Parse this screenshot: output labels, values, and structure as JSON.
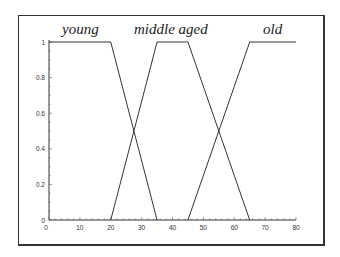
{
  "chart_data": {
    "type": "line",
    "title": "",
    "xlabel": "",
    "ylabel": "",
    "xlim": [
      0,
      80
    ],
    "ylim": [
      0,
      1
    ],
    "grid": false,
    "x_ticks": [
      "0",
      "10",
      "20",
      "30",
      "40",
      "50",
      "60",
      "70",
      "80"
    ],
    "y_ticks": [
      "0",
      "0.2",
      "0.4",
      "0.6",
      "0.8",
      "1"
    ],
    "series": [
      {
        "name": "young",
        "x": [
          0,
          20,
          35
        ],
        "y": [
          1,
          1,
          0
        ]
      },
      {
        "name": "middle aged",
        "x": [
          20,
          35,
          45,
          65
        ],
        "y": [
          0,
          1,
          1,
          0
        ]
      },
      {
        "name": "old",
        "x": [
          45,
          65,
          80
        ],
        "y": [
          0,
          1,
          1
        ]
      }
    ],
    "annotations": [
      "young",
      "middle aged",
      "old"
    ]
  },
  "labels": {
    "young": "young",
    "middle": "middle aged",
    "old": "old"
  }
}
